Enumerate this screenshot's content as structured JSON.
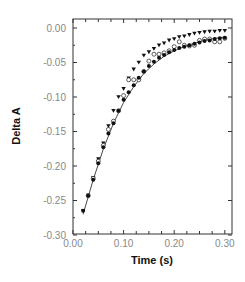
{
  "chart_data": {
    "type": "scatter",
    "title": "",
    "xlabel": "Time (s)",
    "ylabel": "Delta A",
    "xlim": [
      0.0,
      0.31
    ],
    "ylim": [
      -0.3,
      0.013
    ],
    "xticks": [
      0.0,
      0.1,
      0.2,
      0.3
    ],
    "xtick_labels": [
      "0.00",
      "0.10",
      "0.20",
      "0.30"
    ],
    "yticks": [
      0.0,
      -0.05,
      -0.1,
      -0.15,
      -0.2,
      -0.25,
      -0.3
    ],
    "ytick_labels": [
      "0.00",
      "-0.05",
      "-0.10",
      "-0.15",
      "-0.20",
      "-0.25",
      "-0.30"
    ],
    "grid": false,
    "legend": "none",
    "series": [
      {
        "name": "triangles",
        "marker": "triangle-down",
        "x": [
          0.02,
          0.03,
          0.04,
          0.05,
          0.06,
          0.07,
          0.08,
          0.09,
          0.1,
          0.11,
          0.12,
          0.13,
          0.14,
          0.15,
          0.16,
          0.17,
          0.18,
          0.19,
          0.2,
          0.21,
          0.22,
          0.23,
          0.24,
          0.25,
          0.26,
          0.27,
          0.28,
          0.29,
          0.3
        ],
        "y": [
          -0.265,
          -0.243,
          -0.217,
          -0.19,
          -0.167,
          -0.142,
          -0.12,
          -0.1,
          -0.088,
          -0.073,
          -0.06,
          -0.05,
          -0.04,
          -0.035,
          -0.03,
          -0.025,
          -0.022,
          -0.018,
          -0.016,
          -0.013,
          -0.012,
          -0.01,
          -0.008,
          -0.007,
          -0.006,
          -0.005,
          -0.005,
          -0.004,
          -0.004
        ]
      },
      {
        "name": "open circles",
        "marker": "circle-open",
        "x": [
          0.03,
          0.04,
          0.05,
          0.06,
          0.07,
          0.08,
          0.09,
          0.1,
          0.11,
          0.12,
          0.13,
          0.14,
          0.15,
          0.16,
          0.17,
          0.18,
          0.19,
          0.2,
          0.21,
          0.22,
          0.23,
          0.24,
          0.25,
          0.26,
          0.27,
          0.28,
          0.29,
          0.3
        ],
        "y": [
          -0.243,
          -0.218,
          -0.193,
          -0.17,
          -0.147,
          -0.135,
          -0.12,
          -0.098,
          -0.075,
          -0.075,
          -0.075,
          -0.063,
          -0.048,
          -0.038,
          -0.038,
          -0.036,
          -0.033,
          -0.027,
          -0.02,
          -0.025,
          -0.026,
          -0.025,
          -0.018,
          -0.016,
          -0.016,
          -0.02,
          -0.02,
          -0.015
        ]
      },
      {
        "name": "filled circles",
        "marker": "circle-filled",
        "x": [
          0.02,
          0.03,
          0.04,
          0.05,
          0.06,
          0.07,
          0.08,
          0.09,
          0.1,
          0.11,
          0.12,
          0.13,
          0.14,
          0.15,
          0.16,
          0.17,
          0.18,
          0.19,
          0.2,
          0.21,
          0.22,
          0.23,
          0.24,
          0.25,
          0.26,
          0.27,
          0.28,
          0.29,
          0.3
        ],
        "y": [
          -0.265,
          -0.243,
          -0.22,
          -0.196,
          -0.173,
          -0.153,
          -0.138,
          -0.12,
          -0.104,
          -0.093,
          -0.083,
          -0.072,
          -0.063,
          -0.055,
          -0.049,
          -0.043,
          -0.039,
          -0.035,
          -0.032,
          -0.029,
          -0.027,
          -0.025,
          -0.023,
          -0.021,
          -0.019,
          -0.018,
          -0.016,
          -0.015,
          -0.014
        ]
      }
    ],
    "fit_curve": {
      "name": "fit",
      "type": "line",
      "x": [
        0.02,
        0.04,
        0.06,
        0.08,
        0.1,
        0.12,
        0.14,
        0.16,
        0.18,
        0.2,
        0.22,
        0.24,
        0.26,
        0.28,
        0.3
      ],
      "y": [
        -0.27,
        -0.22,
        -0.175,
        -0.138,
        -0.108,
        -0.085,
        -0.066,
        -0.052,
        -0.041,
        -0.033,
        -0.027,
        -0.022,
        -0.018,
        -0.015,
        -0.013
      ]
    }
  }
}
